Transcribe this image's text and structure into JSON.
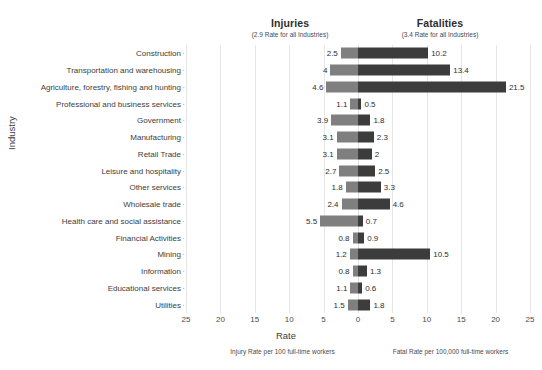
{
  "header": {
    "injuries_title": "Injuries",
    "injuries_subtitle": "(2.9 Rate for all Industries)",
    "fatalities_title": "Fatalities",
    "fatalities_subtitle": "(3.4 Rate for all Industries)"
  },
  "axes": {
    "ylabel": "Industry",
    "xlabel": "Rate",
    "xticks": [
      "25",
      "20",
      "15",
      "10",
      "5",
      "0",
      "5",
      "10",
      "15",
      "20",
      "25"
    ]
  },
  "footnotes": {
    "left": "Injury Rate per 100 full-time workers",
    "right": "Fatal Rate per 100,000 full-time workers"
  },
  "colors": {
    "injury_bar": "#7f7f7f",
    "fatality_bar": "#3c3c3c",
    "gridline": "#e6e6e6",
    "text": "#3d3d3d"
  },
  "chart_data": {
    "type": "bar",
    "title": "",
    "subtitle": "",
    "orientation": "horizontal-diverging",
    "xlabel": "Rate",
    "ylabel": "Industry",
    "xlim": [
      -25,
      25
    ],
    "grid": true,
    "legend_position": "top",
    "axis_note_left": "Injury Rate per 100 full-time workers",
    "axis_note_right": "Fatal Rate per 100,000 full-time workers",
    "reference_values": {
      "injuries_all_industries": 2.9,
      "fatalities_all_industries": 3.4
    },
    "categories": [
      "Construction",
      "Transportation and warehousing",
      "Agriculture, forestry, fishing and hunting",
      "Professional and business services",
      "Government",
      "Manufacturing",
      "Retail Trade",
      "Leisure and hospitality",
      "Other services",
      "Wholesale trade",
      "Health care and social assistance",
      "Financial Activities",
      "Mining",
      "Information",
      "Educational services",
      "Utilities"
    ],
    "series": [
      {
        "name": "Injuries",
        "direction": "left",
        "color": "#7f7f7f",
        "values": [
          2.5,
          4,
          4.6,
          1.1,
          3.9,
          3.1,
          3.1,
          2.7,
          1.8,
          2.4,
          5.5,
          0.8,
          1.2,
          0.8,
          1.1,
          1.5
        ],
        "labels": [
          "2.5",
          "4",
          "4.6",
          "1.1",
          "3.9",
          "3.1",
          "3.1",
          "2.7",
          "1.8",
          "2.4",
          "5.5",
          "0.8",
          "1.2",
          "0.8",
          "1.1",
          "1.5"
        ]
      },
      {
        "name": "Fatalities",
        "direction": "right",
        "color": "#3c3c3c",
        "values": [
          10.2,
          13.4,
          21.5,
          0.5,
          1.8,
          2.3,
          2,
          2.5,
          3.3,
          4.6,
          0.7,
          0.9,
          10.5,
          1.3,
          0.6,
          1.8
        ],
        "labels": [
          "10.2",
          "13.4",
          "21.5",
          "0.5",
          "1.8",
          "2.3",
          "2",
          "2.5",
          "3.3",
          "4.6",
          "0.7",
          "0.9",
          "10.5",
          "1.3",
          "0.6",
          "1.8"
        ]
      }
    ]
  }
}
